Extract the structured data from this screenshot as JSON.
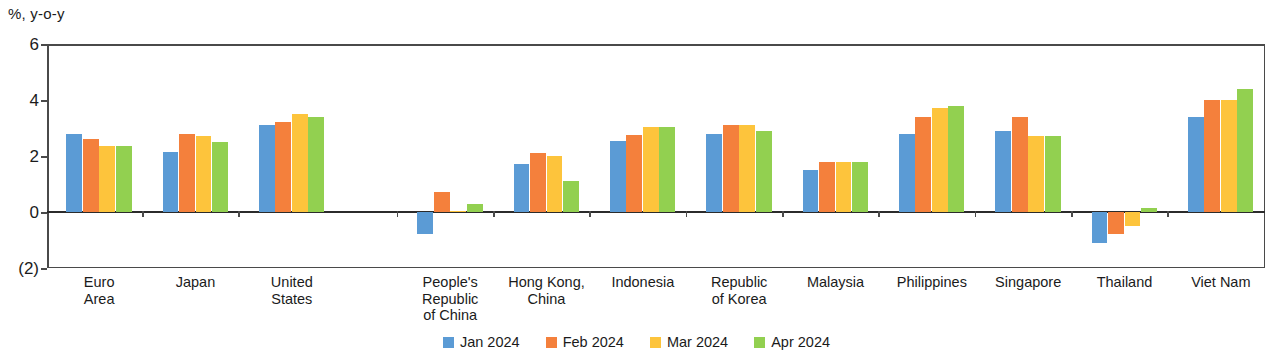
{
  "axis_unit_label": "%, y-o-y",
  "chart_data": {
    "type": "bar",
    "title": "",
    "subtitle": "",
    "xlabel": "",
    "ylabel": "%, y-o-y",
    "ylim": [
      -2,
      6
    ],
    "yticks": [
      6,
      4,
      2,
      0,
      -2
    ],
    "ytick_labels": [
      "6",
      "4",
      "2",
      "0",
      "(2)"
    ],
    "grid": false,
    "legend_position": "bottom-center",
    "categories": [
      "Euro\nArea",
      "Japan",
      "United\nStates",
      "People's\nRepublic\nof China",
      "Hong Kong,\nChina",
      "Indonesia",
      "Republic\nof Korea",
      "Malaysia",
      "Philippines",
      "Singapore",
      "Thailand",
      "Viet Nam"
    ],
    "category_labels": [
      [
        "Euro",
        "Area"
      ],
      [
        "Japan"
      ],
      [
        "United",
        "States"
      ],
      [
        "People's",
        "Republic",
        "of China"
      ],
      [
        "Hong Kong,",
        "China"
      ],
      [
        "Indonesia"
      ],
      [
        "Republic",
        "of Korea"
      ],
      [
        "Malaysia"
      ],
      [
        "Philippines"
      ],
      [
        "Singapore"
      ],
      [
        "Thailand"
      ],
      [
        "Viet Nam"
      ]
    ],
    "series": [
      {
        "name": "Jan 2024",
        "color": "#5B9BD5",
        "values": [
          2.8,
          2.15,
          3.1,
          -0.8,
          1.7,
          2.55,
          2.8,
          1.5,
          2.8,
          2.9,
          -1.1,
          3.4
        ]
      },
      {
        "name": "Feb 2024",
        "color": "#F4803C",
        "values": [
          2.6,
          2.8,
          3.2,
          0.7,
          2.1,
          2.75,
          3.1,
          1.8,
          3.4,
          3.4,
          -0.8,
          4.0
        ]
      },
      {
        "name": "Mar 2024",
        "color": "#FDC43C",
        "values": [
          2.35,
          2.7,
          3.5,
          0.05,
          2.0,
          3.05,
          3.1,
          1.8,
          3.7,
          2.7,
          -0.5,
          4.0
        ]
      },
      {
        "name": "Apr 2024",
        "color": "#92D050",
        "values": [
          2.35,
          2.5,
          3.4,
          0.3,
          1.1,
          3.05,
          2.9,
          1.8,
          3.8,
          2.7,
          0.15,
          4.4
        ]
      }
    ]
  },
  "legend": {
    "items": [
      {
        "label": "Jan 2024",
        "color": "#5B9BD5"
      },
      {
        "label": "Feb 2024",
        "color": "#F4803C"
      },
      {
        "label": "Mar 2024",
        "color": "#FDC43C"
      },
      {
        "label": "Apr 2024",
        "color": "#92D050"
      }
    ]
  }
}
